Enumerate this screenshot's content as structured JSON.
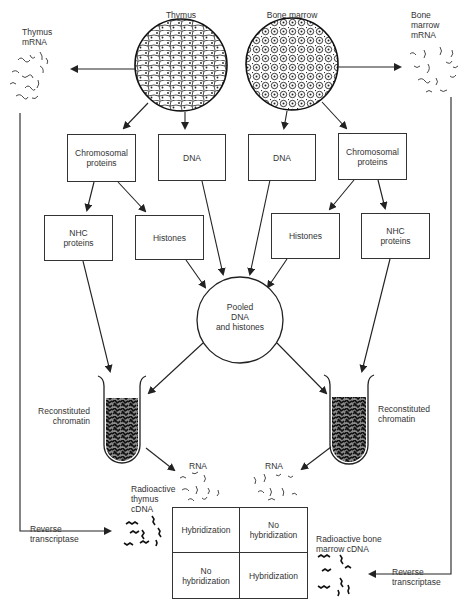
{
  "diagram": {
    "type": "flowchart",
    "sources": {
      "thymus": {
        "label": "Thymus"
      },
      "bone_marrow": {
        "label": "Bone marrow"
      }
    },
    "mrna": {
      "thymus": {
        "line1": "Thymus",
        "line2": "mRNA"
      },
      "bone_marrow": {
        "line1": "Bone",
        "line2": "marrow",
        "line3": "mRNA"
      }
    },
    "left_branch": {
      "chromosomal_proteins": {
        "line1": "Chromosomal",
        "line2": "proteins"
      },
      "dna": "DNA",
      "nhc_proteins": {
        "line1": "NHC",
        "line2": "proteins"
      },
      "histones": "Histones"
    },
    "right_branch": {
      "dna": "DNA",
      "chromosomal_proteins": {
        "line1": "Chromosomal",
        "line2": "proteins"
      },
      "histones": "Histones",
      "nhc_proteins": {
        "line1": "NHC",
        "line2": "proteins"
      }
    },
    "pooled": {
      "line1": "Pooled",
      "line2": "DNA",
      "line3": "and histones"
    },
    "chromatin": {
      "left": {
        "line1": "Reconstituted",
        "line2": "chromatin"
      },
      "right": {
        "line1": "Reconstituted",
        "line2": "chromatin"
      }
    },
    "rna": {
      "left": "RNA",
      "right": "RNA"
    },
    "cdna": {
      "thymus": {
        "line1": "Radioactive",
        "line2": "thymus",
        "line3": "cDNA"
      },
      "bone_marrow": {
        "line1": "Radioactive bone",
        "line2": "marrow cDNA"
      }
    },
    "reverse_transcriptase": {
      "left": {
        "line1": "Reverse",
        "line2": "transcriptase"
      },
      "right": {
        "line1": "Reverse",
        "line2": "transcriptase"
      }
    },
    "result_grid": {
      "top_left": {
        "line1": "Hybridization"
      },
      "top_right": {
        "line1": "No",
        "line2": "hybridization"
      },
      "bottom_left": {
        "line1": "No",
        "line2": "hybridization"
      },
      "bottom_right": {
        "line1": "Hybridization"
      }
    },
    "colors": {
      "ink": "#2a2a2a",
      "tube_fill": "#8a8a8a",
      "background": "#ffffff"
    }
  }
}
